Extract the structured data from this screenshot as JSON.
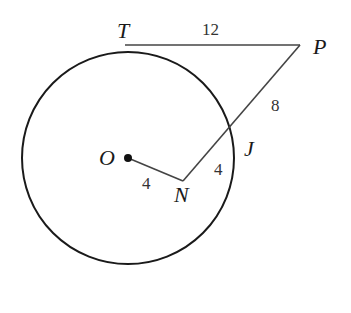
{
  "diagram": {
    "circle": {
      "center_label": "O",
      "cx": 128,
      "cy": 158,
      "r": 106
    },
    "points": {
      "T": {
        "label": "T",
        "x": 125,
        "y": 45
      },
      "P": {
        "label": "P",
        "x": 300,
        "y": 45
      },
      "J": {
        "label": "J",
        "x": 233,
        "y": 130
      },
      "N": {
        "label": "N",
        "x": 183,
        "y": 181
      },
      "O": {
        "label": "O",
        "x": 128,
        "y": 158
      }
    },
    "segments": {
      "TP": {
        "label": "12"
      },
      "PJ": {
        "label": "8"
      },
      "JN": {
        "label": "4"
      },
      "ON": {
        "label": "4"
      }
    },
    "colors": {
      "stroke": "#1a1a1a",
      "line": "#444444"
    }
  }
}
